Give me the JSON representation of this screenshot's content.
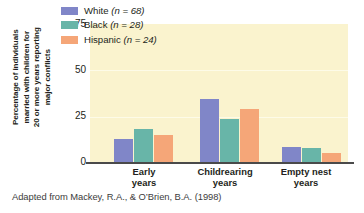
{
  "chart_data": {
    "type": "bar",
    "title": "",
    "xlabel": "",
    "ylabel": "Percentage of individuals married with children for 20 or more years reporting major conflicts",
    "ylabel_lines": [
      "Percentage of individuals",
      "married with children for",
      "20 or more years reporting",
      "major conflicts"
    ],
    "categories": [
      "Early years",
      "Childrearing years",
      "Empty nest years"
    ],
    "category_lines": [
      [
        "Early",
        "years"
      ],
      [
        "Childrearing",
        "years"
      ],
      [
        "Empty nest",
        "years"
      ]
    ],
    "series": [
      {
        "name": "White",
        "n": 68,
        "values": [
          13,
          34.5,
          8.5
        ],
        "color": "#8086c8"
      },
      {
        "name": "Black",
        "n": 28,
        "values": [
          18.5,
          23.5,
          8
        ],
        "color": "#68b5a8"
      },
      {
        "name": "Hispanic",
        "n": 24,
        "values": [
          15,
          29,
          5.5
        ],
        "color": "#f5a678"
      }
    ],
    "ylim": [
      0,
      75
    ],
    "yticks": [
      0,
      25,
      50,
      75
    ],
    "ytick_labels": [
      "0",
      "25",
      "50",
      "75"
    ],
    "grid": true,
    "legend_position": "top-center",
    "legend_entries": [
      {
        "label": "White",
        "n_text": "(n = 68)",
        "color": "#8086c8"
      },
      {
        "label": "Black",
        "n_text": "(n = 28)",
        "color": "#68b5a8"
      },
      {
        "label": "Hispanic",
        "n_text": "(n = 24)",
        "color": "#f5a678"
      }
    ],
    "plot_background": "#faf3ce",
    "page_background": "#ffffff",
    "axis_color": "#4a4a4a"
  },
  "caption": {
    "text": "Adapted from Mackey, R.A., & O’Brien, B.A. (1998)"
  }
}
